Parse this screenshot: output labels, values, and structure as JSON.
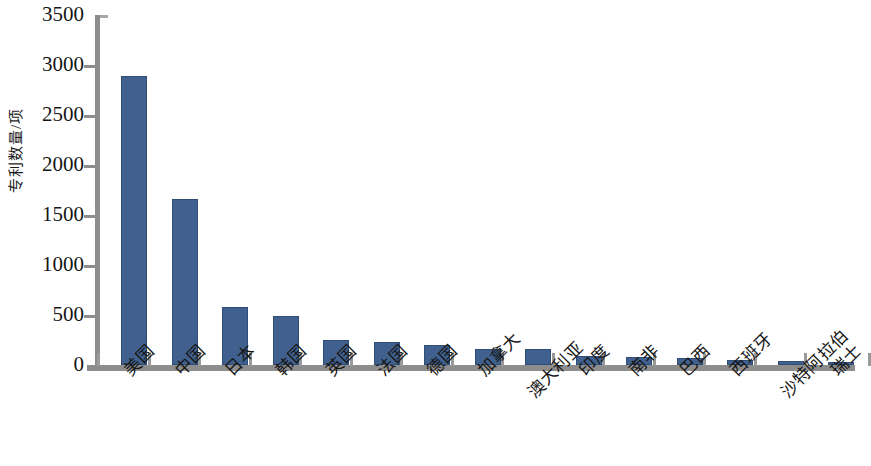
{
  "chart_data": {
    "type": "bar",
    "title": "",
    "subtitle": "",
    "xlabel": "",
    "ylabel": "专利数量/项",
    "ylim": [
      0,
      3500
    ],
    "ytick_step": 500,
    "yticks": [
      3500,
      3000,
      2500,
      2000,
      1500,
      1000,
      500,
      0
    ],
    "ytick_labels": [
      "3500",
      "3000",
      "2500",
      "2000",
      "1500",
      "1000",
      "500",
      "0"
    ],
    "grid": false,
    "legend": null,
    "bar_color": "#40618f",
    "axis_color": "#8d8d8d",
    "categories": [
      "美国",
      "中国",
      "日本",
      "韩国",
      "英国",
      "法国",
      "德国",
      "加拿大",
      "澳大利亚",
      "印度",
      "南非",
      "巴西",
      "西班牙",
      "沙特阿拉伯",
      "瑞士"
    ],
    "values": [
      2890,
      1665,
      580,
      490,
      250,
      230,
      200,
      165,
      160,
      90,
      80,
      70,
      50,
      45,
      30
    ],
    "bars": [
      {
        "label": "美国",
        "value": 2890,
        "lowered_label": false
      },
      {
        "label": "中国",
        "value": 1665,
        "lowered_label": false
      },
      {
        "label": "日本",
        "value": 580,
        "lowered_label": false
      },
      {
        "label": "韩国",
        "value": 490,
        "lowered_label": false
      },
      {
        "label": "英国",
        "value": 250,
        "lowered_label": false
      },
      {
        "label": "法国",
        "value": 230,
        "lowered_label": false
      },
      {
        "label": "德国",
        "value": 200,
        "lowered_label": false
      },
      {
        "label": "加拿大",
        "value": 165,
        "lowered_label": false
      },
      {
        "label": "澳大利亚",
        "value": 160,
        "lowered_label": true
      },
      {
        "label": "印度",
        "value": 90,
        "lowered_label": false
      },
      {
        "label": "南非",
        "value": 80,
        "lowered_label": false
      },
      {
        "label": "巴西",
        "value": 70,
        "lowered_label": false
      },
      {
        "label": "西班牙",
        "value": 50,
        "lowered_label": false
      },
      {
        "label": "沙特阿拉伯",
        "value": 45,
        "lowered_label": true
      },
      {
        "label": "瑞士",
        "value": 30,
        "lowered_label": false
      }
    ]
  }
}
